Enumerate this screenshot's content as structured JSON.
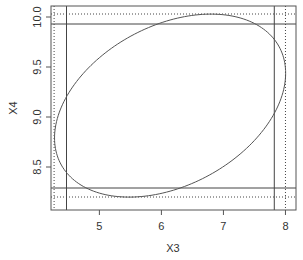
{
  "chart_data": {
    "type": "line",
    "title": "",
    "xlabel": "X3",
    "ylabel": "X4",
    "xlim": [
      4.22,
      8.17
    ],
    "ylim": [
      8.07,
      10.11
    ],
    "xticks": [
      5,
      6,
      7,
      8
    ],
    "xtick_labels": [
      "5",
      "6",
      "7",
      "8"
    ],
    "yticks": [
      8.5,
      9.0,
      9.5,
      10.0
    ],
    "ytick_labels": [
      "8.5",
      "9.0",
      "9.5",
      "10.0"
    ],
    "grid": false,
    "ellipse": {
      "center": [
        6.14,
        9.114
      ],
      "x_half_extent": 1.863,
      "y_half_extent": 0.915,
      "cos_phase": 0.354,
      "orientation": "negative-slope"
    },
    "vertical_lines": [
      {
        "x": 4.47,
        "style": "solid"
      },
      {
        "x": 7.82,
        "style": "solid"
      },
      {
        "x": 4.27,
        "style": "dotted"
      },
      {
        "x": 8.0,
        "style": "dotted"
      }
    ],
    "horizontal_lines": [
      {
        "y": 9.93,
        "style": "solid"
      },
      {
        "y": 8.29,
        "style": "solid"
      },
      {
        "y": 10.03,
        "style": "dotted"
      },
      {
        "y": 8.2,
        "style": "dotted"
      }
    ]
  }
}
